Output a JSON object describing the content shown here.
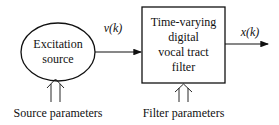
{
  "diagram": {
    "source_block": {
      "line1": "Excitation",
      "line2": "source"
    },
    "filter_block": {
      "line1": "Time-varying",
      "line2": "digital",
      "line3": "vocal tract",
      "line4": "filter"
    },
    "signal_in": "v(k)",
    "signal_out": "x(k)",
    "source_params": "Source parameters",
    "filter_params": "Filter parameters"
  }
}
